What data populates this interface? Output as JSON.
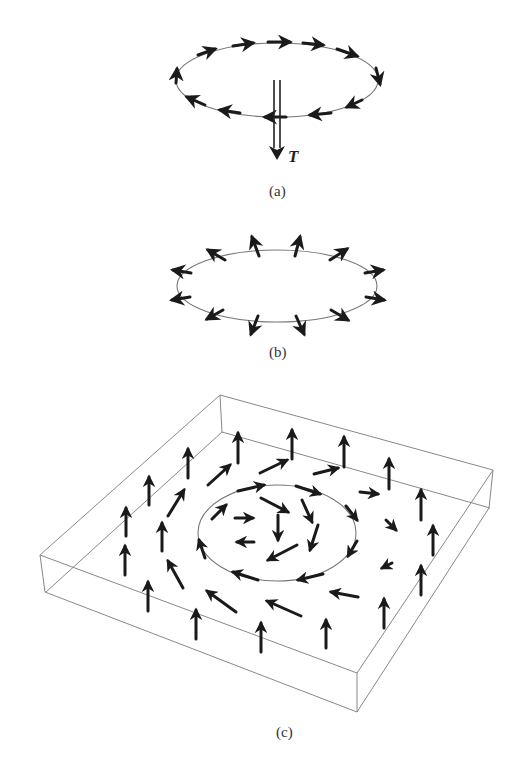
{
  "figure": {
    "panels": [
      {
        "id": "a",
        "label": "(a)",
        "description": "Circular loop of spins tangent to a ring, with torque/translation vector pointing down",
        "vector_label": "T"
      },
      {
        "id": "b",
        "label": "(b)",
        "description": "Ring of spins pointing radially outward (hedgehog-like ring)"
      },
      {
        "id": "c",
        "label": "(c)",
        "description": "3D slab showing a vortex-like spin texture on a plane, with arrows circulating around an inner ring and pointing up near the edges"
      }
    ],
    "colors": {
      "arrow": "#1a1a1a",
      "curve": "#777777",
      "box": "#888888",
      "background": "#ffffff"
    }
  }
}
